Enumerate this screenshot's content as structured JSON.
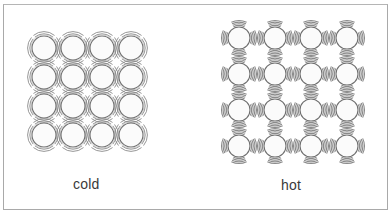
{
  "diagram": {
    "title": "",
    "panels": [
      {
        "id": "cold",
        "label": "cold",
        "rows": 4,
        "cols": 4,
        "origin": [
          44,
          48
        ],
        "spacing": [
          29,
          29
        ],
        "particle_radius": 12,
        "vibration": "small",
        "vibration_arcs": 2
      },
      {
        "id": "hot",
        "label": "hot",
        "rows": 4,
        "cols": 4,
        "origin": [
          239,
          38
        ],
        "spacing": [
          36,
          36
        ],
        "particle_radius": 11,
        "vibration": "large",
        "vibration_arcs": 4
      }
    ],
    "colors": {
      "frame": "#a9a9a9",
      "particle_stroke": "#6e6e6e",
      "vibration_stroke": "#8a8a8a",
      "label": "#3a3a3a",
      "background": "#ffffff"
    }
  }
}
